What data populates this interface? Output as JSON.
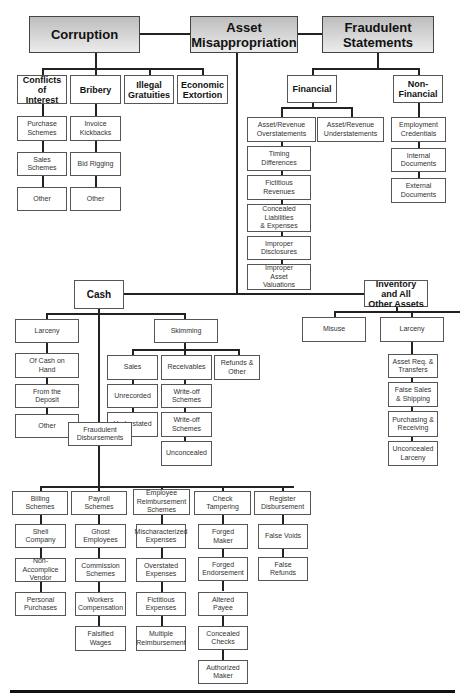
{
  "categories": {
    "corruption": {
      "label": "Corruption",
      "children": [
        {
          "label": "Conflicts of\nInterest",
          "children": [
            "Purchase\nSchemes",
            "Sales\nSchemes",
            "Other"
          ]
        },
        {
          "label": "Bribery",
          "children": [
            "Invoice\nKickbacks",
            "Bid Rigging",
            "Other"
          ]
        },
        {
          "label": "Illegal\nGratuities"
        },
        {
          "label": "Economic\nExtortion"
        }
      ]
    },
    "asset_misappropriation": {
      "label": "Asset\nMisappropriation",
      "cash": {
        "label": "Cash",
        "larceny": {
          "label": "Larceny",
          "children": [
            "Of Cash on\nHand",
            "From the\nDeposit",
            "Other"
          ]
        },
        "skimming": {
          "label": "Skimming",
          "sales": {
            "label": "Sales",
            "children": [
              "Unrecorded",
              "Understated"
            ]
          },
          "receivables": {
            "label": "Receivables",
            "children": [
              "Write-off\nSchemes",
              "Write-off\nSchemes",
              "Unconcealed"
            ]
          },
          "refunds": {
            "label": "Refunds &\nOther"
          }
        },
        "fraudulent_disbursements": {
          "label": "Fraudulent\nDisbursements",
          "billing": {
            "label": "Billing\nSchemes",
            "children": [
              "Shell\nCompany",
              "Non-Accomplice\nVendor",
              "Personal\nPurchases"
            ]
          },
          "payroll": {
            "label": "Payroll\nSchemes",
            "children": [
              "Ghost\nEmployees",
              "Commission\nSchemes",
              "Workers\nCompensation",
              "Falsified\nWages"
            ]
          },
          "expense": {
            "label": "Employee\nReimbursement\nSchemes",
            "children": [
              "Mischaracterized\nExpenses",
              "Overstated\nExpenses",
              "Fictitious\nExpenses",
              "Multiple\nReimbursement"
            ]
          },
          "check": {
            "label": "Check\nTampering",
            "children": [
              "Forged\nMaker",
              "Forged\nEndorsement",
              "Altered\nPayee",
              "Concealed\nChecks",
              "Authorized\nMaker"
            ]
          },
          "register": {
            "label": "Register\nDisbursement",
            "children": [
              "False Voids",
              "False\nRefunds"
            ]
          }
        }
      },
      "inventory": {
        "label": "Inventory\nand All\nOther Assets",
        "misuse": {
          "label": "Misuse"
        },
        "larceny": {
          "label": "Larceny",
          "children": [
            "Asset Req. &\nTransfers",
            "False Sales\n& Shipping",
            "Purchasing &\nReceiving",
            "Unconcealed\nLarceny"
          ]
        }
      }
    },
    "fraudulent_statements": {
      "label": "Fraudulent\nStatements",
      "financial": {
        "label": "Financial",
        "overstatements": {
          "label": "Asset/Revenue\nOverstatements",
          "children": [
            "Timing\nDifferences",
            "Fictitious\nRevenues",
            "Concealed\nLiabilities\n& Expenses",
            "Improper\nDisclosures",
            "Improper\nAsset\nValuations"
          ]
        },
        "understatements": {
          "label": "Asset/Revenue\nUnderstatements"
        }
      },
      "non_financial": {
        "label": "Non-\nFinancial",
        "children": [
          "Employment\nCredentials",
          "Internal\nDocuments",
          "External\nDocuments"
        ]
      }
    }
  }
}
